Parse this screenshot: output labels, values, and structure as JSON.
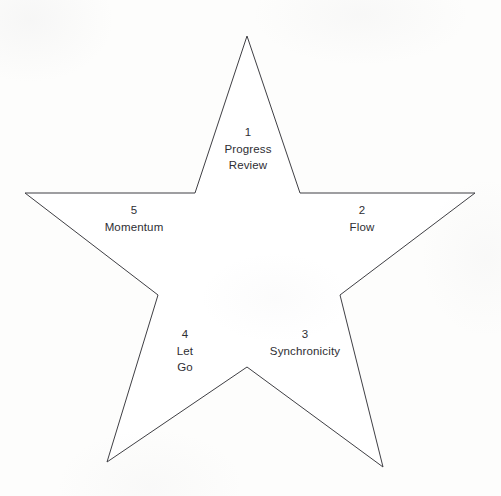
{
  "diagram": {
    "type": "five-point-star",
    "style": {
      "background_color": "#fdfdfc",
      "star_fill": "#ffffff",
      "stroke_color": "#3f3f44",
      "text_color": "#2e2e33"
    },
    "star_geometry": {
      "outer_points": [
        {
          "name": "top",
          "x": 247,
          "y": 36
        },
        {
          "name": "right",
          "x": 475,
          "y": 193
        },
        {
          "name": "bottom-right",
          "x": 383,
          "y": 467
        },
        {
          "name": "bottom-left",
          "x": 107,
          "y": 462
        },
        {
          "name": "left",
          "x": 25,
          "y": 193
        }
      ],
      "inner_points": [
        {
          "name": "inner-top-right",
          "x": 300,
          "y": 193
        },
        {
          "name": "inner-right",
          "x": 340,
          "y": 295
        },
        {
          "name": "inner-bottom",
          "x": 247,
          "y": 367
        },
        {
          "name": "inner-left",
          "x": 158,
          "y": 295
        },
        {
          "name": "inner-top-left",
          "x": 195,
          "y": 193
        }
      ],
      "polygon_points": "247,36 300,193 475,193 340,295 383,467 247,367 107,462 158,295 25,193 195,193"
    },
    "segments": [
      {
        "id": "segment-1",
        "number": "1",
        "label_line1": "Progress",
        "label_line2": "Review",
        "x": 248,
        "y": 124
      },
      {
        "id": "segment-2",
        "number": "2",
        "label_line1": "Flow",
        "label_line2": "",
        "x": 362,
        "y": 202
      },
      {
        "id": "segment-3",
        "number": "3",
        "label_line1": "Synchronicity",
        "label_line2": "",
        "x": 305,
        "y": 326
      },
      {
        "id": "segment-4",
        "number": "4",
        "label_line1": "Let",
        "label_line2": "Go",
        "x": 185,
        "y": 326
      },
      {
        "id": "segment-5",
        "number": "5",
        "label_line1": "Momentum",
        "label_line2": "",
        "x": 134,
        "y": 202
      }
    ]
  }
}
